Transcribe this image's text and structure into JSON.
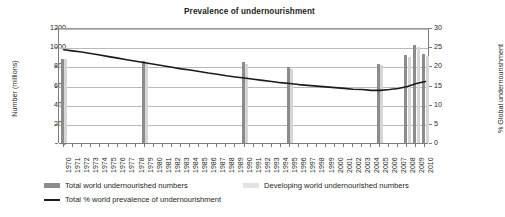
{
  "chart_data": {
    "type": "bar",
    "title": "Prevalence of undernourishment",
    "xlabel": "",
    "ylabel": "Number (millions)",
    "ylabel_right": "% Global undernourishment",
    "ylim": [
      0,
      1200
    ],
    "ylim_right": [
      0,
      30
    ],
    "yticks": [
      0,
      200,
      400,
      600,
      800,
      1000,
      1200
    ],
    "yticks_right": [
      0,
      5,
      10,
      15,
      20,
      25,
      30
    ],
    "grid": true,
    "legend_position": "bottom",
    "categories": [
      "1970",
      "1971",
      "1972",
      "1973",
      "1974",
      "1975",
      "1976",
      "1977",
      "1978",
      "1979",
      "1980",
      "1981",
      "1982",
      "1983",
      "1984",
      "1985",
      "1986",
      "1987",
      "1988",
      "1989",
      "1990",
      "1991",
      "1992",
      "1993",
      "1994",
      "1995",
      "1996",
      "1997",
      "1998",
      "1999",
      "2000",
      "2001",
      "2002",
      "2003",
      "2004",
      "2005",
      "2006",
      "2007",
      "2008",
      "2009",
      "2010"
    ],
    "series": [
      {
        "name": "Total world undernourished numbers",
        "type": "bar",
        "color": "#8c8c8c",
        "axis": "left",
        "values": [
          878,
          null,
          null,
          null,
          null,
          null,
          null,
          null,
          null,
          853,
          null,
          null,
          null,
          null,
          null,
          null,
          null,
          null,
          null,
          null,
          843,
          null,
          null,
          null,
          null,
          788,
          null,
          null,
          null,
          null,
          null,
          null,
          null,
          null,
          null,
          825,
          null,
          null,
          915,
          1023,
          925
        ]
      },
      {
        "name": "Developing world undernourished numbers",
        "type": "bar",
        "color": "#d6d6d6",
        "axis": "left",
        "values": [
          872,
          null,
          null,
          null,
          null,
          null,
          null,
          null,
          null,
          847,
          null,
          null,
          null,
          null,
          null,
          null,
          null,
          null,
          null,
          null,
          827,
          null,
          null,
          null,
          null,
          775,
          null,
          null,
          null,
          null,
          null,
          null,
          null,
          null,
          null,
          810,
          null,
          null,
          898,
          1002,
          906
        ]
      },
      {
        "name": "Total % world prevalence of undernourishment",
        "type": "line",
        "color": "#1a1a1a",
        "axis": "right",
        "values": [
          24.6,
          24.3,
          24.0,
          23.6,
          23.2,
          22.8,
          22.4,
          22.0,
          21.6,
          21.2,
          20.8,
          20.4,
          20.0,
          19.6,
          19.3,
          18.9,
          18.5,
          18.2,
          17.8,
          17.5,
          17.2,
          16.9,
          16.6,
          16.3,
          16.0,
          15.8,
          15.5,
          15.3,
          15.1,
          14.9,
          14.7,
          14.5,
          14.3,
          14.2,
          14.0,
          14.0,
          14.2,
          14.5,
          15.0,
          15.8,
          16.3
        ]
      }
    ]
  },
  "legend": {
    "items": [
      {
        "label": "Total world undernourished numbers",
        "marker": "bar-swatch-dark"
      },
      {
        "label": "Developing world undernourished numbers",
        "marker": "bar-swatch-light"
      },
      {
        "label": "Total % world prevalence of undernourishment",
        "marker": "line-swatch"
      }
    ]
  },
  "colors": {
    "bar_total": "#8c8c8c",
    "bar_developing": "#d6d6d6",
    "line": "#1a1a1a",
    "grid": "#b9b9b9",
    "axis": "#7d7d7d",
    "text": "#231f20",
    "background": "#ffffff"
  }
}
